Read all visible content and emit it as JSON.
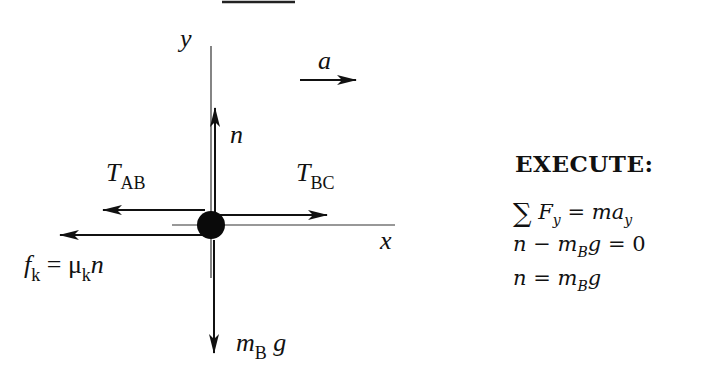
{
  "diagram": {
    "axes": {
      "x_label": "x",
      "y_label": "y"
    },
    "acceleration": {
      "label": "a",
      "direction": "right"
    },
    "forces": [
      {
        "id": "normal",
        "symbol": "n",
        "direction": "up"
      },
      {
        "id": "tension_ab",
        "symbol": "T",
        "subscript": "AB",
        "direction": "left"
      },
      {
        "id": "tension_bc",
        "symbol": "T",
        "subscript": "BC",
        "direction": "right"
      },
      {
        "id": "friction",
        "symbol": "f",
        "subscript": "k",
        "rhs_symbol": "μ",
        "rhs_subscript": "k",
        "rhs_var": "n",
        "equals": "=",
        "direction": "left"
      },
      {
        "id": "weight",
        "symbol": "m",
        "subscript": "B",
        "suffix": "g",
        "direction": "down"
      }
    ]
  },
  "execute": {
    "heading": "EXECUTE:",
    "equations": [
      {
        "sum": "∑",
        "lhs": "F",
        "lhs_sub": "y",
        "eq": "=",
        "rhs": "ma",
        "rhs_sub": "y"
      },
      {
        "a": "n",
        "op": "−",
        "b": "m",
        "b_sub": "B",
        "c": "g",
        "eq": "=",
        "rhs": "0"
      },
      {
        "a": "n",
        "eq": "=",
        "b": "m",
        "b_sub": "B",
        "c": "g"
      }
    ]
  }
}
